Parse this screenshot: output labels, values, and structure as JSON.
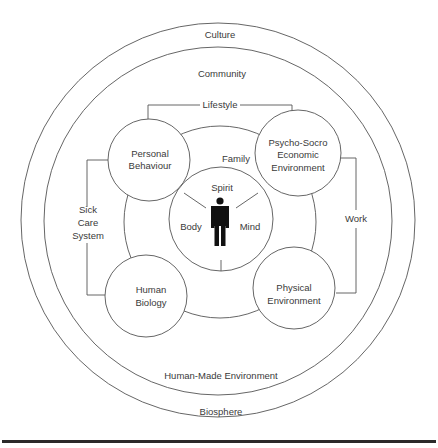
{
  "diagram": {
    "rings": {
      "culture": "Culture",
      "biosphere": "Biosphere",
      "community": "Community",
      "human_made": "Human-Made Environment",
      "family": "Family"
    },
    "connectors": {
      "lifestyle": "Lifestyle",
      "work": "Work",
      "sick_care": [
        "Sick",
        "Care",
        "System"
      ]
    },
    "nodes": {
      "personal_behaviour": [
        "Personal",
        "Behaviour"
      ],
      "psycho_socio": [
        "Psycho-Socro",
        "Economic",
        "Environment"
      ],
      "human_biology": [
        "Human",
        "Biology"
      ],
      "physical_env": [
        "Physical",
        "Environment"
      ]
    },
    "center": {
      "spirit": "Spirit",
      "body": "Body",
      "mind": "Mind",
      "icon": "person-icon"
    }
  },
  "colors": {
    "stroke": "#555555",
    "text": "#3a3a3a",
    "figure": "#111111",
    "rule": "#2b2b2b"
  }
}
